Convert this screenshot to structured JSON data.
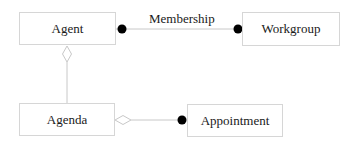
{
  "diagram": {
    "type": "uml-class-diagram",
    "classes": [
      {
        "id": "agent",
        "label": "Agent"
      },
      {
        "id": "workgroup",
        "label": "Workgroup"
      },
      {
        "id": "agenda",
        "label": "Agenda"
      },
      {
        "id": "appointment",
        "label": "Appointment"
      }
    ],
    "relations": [
      {
        "from": "Agent",
        "to": "Workgroup",
        "label": "Membership",
        "from_end": "filled-dot",
        "to_end": "filled-dot"
      },
      {
        "from": "Agent",
        "to": "Agenda",
        "label": "",
        "from_end": "hollow-diamond",
        "to_end": "none"
      },
      {
        "from": "Agenda",
        "to": "Appointment",
        "label": "",
        "from_end": "hollow-diamond",
        "to_end": "filled-dot"
      }
    ],
    "colors": {
      "box_border": "#d6d6d6",
      "line": "#c8c8c8",
      "dot": "#000000",
      "text": "#1a1a1a"
    }
  }
}
